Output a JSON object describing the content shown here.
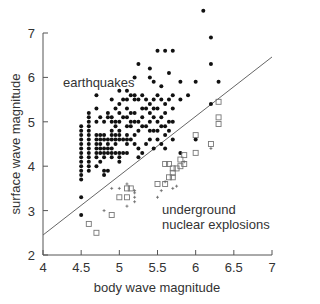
{
  "chart_data": {
    "type": "scatter",
    "title": "",
    "xlabel": "body wave magnitude",
    "ylabel": "surface wave magnitude",
    "xlim": [
      4,
      7
    ],
    "ylim": [
      2,
      7
    ],
    "xticks": [
      "4",
      "4.5",
      "5",
      "5.5",
      "6",
      "6.5",
      "7"
    ],
    "yticks": [
      "2",
      "3",
      "4",
      "5",
      "6",
      "7"
    ],
    "grid": false,
    "annotations": [
      {
        "text": "earthquakes",
        "x": 4.62,
        "y": 6.3
      },
      {
        "text": "underground",
        "x": 5.5,
        "y": 3.15
      },
      {
        "text": "nuclear explosions",
        "x": 5.5,
        "y": 2.85
      }
    ],
    "discriminant_line": {
      "x": [
        4,
        7
      ],
      "y": [
        2.45,
        6.46
      ]
    },
    "series": [
      {
        "name": "earthquakes",
        "marker": "filled-circle",
        "points": [
          [
            4.5,
            2.9
          ],
          [
            4.5,
            3.3
          ],
          [
            4.5,
            3.7
          ],
          [
            4.5,
            3.8
          ],
          [
            4.5,
            3.9
          ],
          [
            4.5,
            4.0
          ],
          [
            4.5,
            4.1
          ],
          [
            4.5,
            4.2
          ],
          [
            4.5,
            4.3
          ],
          [
            4.5,
            4.4
          ],
          [
            4.5,
            4.5
          ],
          [
            4.5,
            4.6
          ],
          [
            4.5,
            4.7
          ],
          [
            4.5,
            4.8
          ],
          [
            4.5,
            4.9
          ],
          [
            4.6,
            3.9
          ],
          [
            4.6,
            4.0
          ],
          [
            4.6,
            4.1
          ],
          [
            4.6,
            4.2
          ],
          [
            4.6,
            4.3
          ],
          [
            4.6,
            4.4
          ],
          [
            4.6,
            4.5
          ],
          [
            4.6,
            4.6
          ],
          [
            4.6,
            4.7
          ],
          [
            4.6,
            4.8
          ],
          [
            4.6,
            4.9
          ],
          [
            4.6,
            5.0
          ],
          [
            4.6,
            5.1
          ],
          [
            4.6,
            5.2
          ],
          [
            4.7,
            4.0
          ],
          [
            4.7,
            4.2
          ],
          [
            4.7,
            4.3
          ],
          [
            4.7,
            4.4
          ],
          [
            4.7,
            4.5
          ],
          [
            4.7,
            4.6
          ],
          [
            4.7,
            4.7
          ],
          [
            4.7,
            5.0
          ],
          [
            4.7,
            5.3
          ],
          [
            4.7,
            5.6
          ],
          [
            4.75,
            4.1
          ],
          [
            4.75,
            4.3
          ],
          [
            4.75,
            4.4
          ],
          [
            4.75,
            4.5
          ],
          [
            4.75,
            4.6
          ],
          [
            4.75,
            4.7
          ],
          [
            4.75,
            5.1
          ],
          [
            4.8,
            3.8
          ],
          [
            4.8,
            3.9
          ],
          [
            4.8,
            4.2
          ],
          [
            4.8,
            4.3
          ],
          [
            4.8,
            4.4
          ],
          [
            4.8,
            4.6
          ],
          [
            4.8,
            4.7
          ],
          [
            4.8,
            5.0
          ],
          [
            4.85,
            3.9
          ],
          [
            4.85,
            4.3
          ],
          [
            4.85,
            4.4
          ],
          [
            4.85,
            4.5
          ],
          [
            4.85,
            4.6
          ],
          [
            4.85,
            5.1
          ],
          [
            4.85,
            5.2
          ],
          [
            4.9,
            4.2
          ],
          [
            4.9,
            4.3
          ],
          [
            4.9,
            4.4
          ],
          [
            4.9,
            4.6
          ],
          [
            4.9,
            4.7
          ],
          [
            4.9,
            4.8
          ],
          [
            4.9,
            5.0
          ],
          [
            4.9,
            5.1
          ],
          [
            4.9,
            5.5
          ],
          [
            4.95,
            4.3
          ],
          [
            4.95,
            4.5
          ],
          [
            4.95,
            4.6
          ],
          [
            4.95,
            4.7
          ],
          [
            4.95,
            4.9
          ],
          [
            4.95,
            5.0
          ],
          [
            4.95,
            5.3
          ],
          [
            5.0,
            4.1
          ],
          [
            5.0,
            4.2
          ],
          [
            5.0,
            4.3
          ],
          [
            5.0,
            4.6
          ],
          [
            5.0,
            4.7
          ],
          [
            5.0,
            4.8
          ],
          [
            5.0,
            5.0
          ],
          [
            5.0,
            5.2
          ],
          [
            5.0,
            5.4
          ],
          [
            5.0,
            5.7
          ],
          [
            5.05,
            4.3
          ],
          [
            5.05,
            4.6
          ],
          [
            5.05,
            5.1
          ],
          [
            5.05,
            5.5
          ],
          [
            5.1,
            4.3
          ],
          [
            5.1,
            4.5
          ],
          [
            5.1,
            4.6
          ],
          [
            5.1,
            4.7
          ],
          [
            5.1,
            4.9
          ],
          [
            5.1,
            5.1
          ],
          [
            5.1,
            5.3
          ],
          [
            5.1,
            5.5
          ],
          [
            5.1,
            5.7
          ],
          [
            5.15,
            4.6
          ],
          [
            5.15,
            4.9
          ],
          [
            5.15,
            5.0
          ],
          [
            5.15,
            5.2
          ],
          [
            5.15,
            5.6
          ],
          [
            5.2,
            4.5
          ],
          [
            5.2,
            4.7
          ],
          [
            5.2,
            5.0
          ],
          [
            5.2,
            5.2
          ],
          [
            5.2,
            5.5
          ],
          [
            5.2,
            5.6
          ],
          [
            5.2,
            6.0
          ],
          [
            5.25,
            4.2
          ],
          [
            5.25,
            4.4
          ],
          [
            5.25,
            4.8
          ],
          [
            5.25,
            5.0
          ],
          [
            5.25,
            5.5
          ],
          [
            5.25,
            6.3
          ],
          [
            5.3,
            4.3
          ],
          [
            5.3,
            4.9
          ],
          [
            5.3,
            5.1
          ],
          [
            5.3,
            5.3
          ],
          [
            5.3,
            5.6
          ],
          [
            5.35,
            4.5
          ],
          [
            5.35,
            4.9
          ],
          [
            5.35,
            5.3
          ],
          [
            5.35,
            5.5
          ],
          [
            5.4,
            4.6
          ],
          [
            5.4,
            4.8
          ],
          [
            5.4,
            5.0
          ],
          [
            5.4,
            5.2
          ],
          [
            5.4,
            5.4
          ],
          [
            5.4,
            6.0
          ],
          [
            5.4,
            6.2
          ],
          [
            5.45,
            4.4
          ],
          [
            5.45,
            4.8
          ],
          [
            5.45,
            5.1
          ],
          [
            5.45,
            5.3
          ],
          [
            5.45,
            5.5
          ],
          [
            5.45,
            5.9
          ],
          [
            5.5,
            4.6
          ],
          [
            5.5,
            4.8
          ],
          [
            5.5,
            5.0
          ],
          [
            5.5,
            5.3
          ],
          [
            5.5,
            5.6
          ],
          [
            5.5,
            6.6
          ],
          [
            5.55,
            4.5
          ],
          [
            5.55,
            4.9
          ],
          [
            5.55,
            5.1
          ],
          [
            5.55,
            5.5
          ],
          [
            5.55,
            5.8
          ],
          [
            5.6,
            4.4
          ],
          [
            5.6,
            4.7
          ],
          [
            5.6,
            4.9
          ],
          [
            5.6,
            5.2
          ],
          [
            5.6,
            5.4
          ],
          [
            5.6,
            6.6
          ],
          [
            5.65,
            4.8
          ],
          [
            5.65,
            5.0
          ],
          [
            5.65,
            5.5
          ],
          [
            5.65,
            6.1
          ],
          [
            5.7,
            4.6
          ],
          [
            5.7,
            5.0
          ],
          [
            5.7,
            5.3
          ],
          [
            5.7,
            5.6
          ],
          [
            5.7,
            6.6
          ],
          [
            5.8,
            4.3
          ],
          [
            5.8,
            5.5
          ],
          [
            5.8,
            5.9
          ],
          [
            5.9,
            5.6
          ],
          [
            6.0,
            4.6
          ],
          [
            6.0,
            5.9
          ],
          [
            6.2,
            5.4
          ],
          [
            6.2,
            6.3
          ],
          [
            6.2,
            6.9
          ],
          [
            6.1,
            7.5
          ],
          [
            6.3,
            5.9
          ]
        ]
      },
      {
        "name": "underground nuclear explosions (squares)",
        "marker": "open-square",
        "points": [
          [
            4.6,
            2.7
          ],
          [
            4.7,
            2.5
          ],
          [
            4.9,
            2.9
          ],
          [
            5.0,
            3.3
          ],
          [
            5.1,
            3.3
          ],
          [
            5.1,
            3.5
          ],
          [
            5.15,
            3.5
          ],
          [
            5.5,
            3.6
          ],
          [
            5.6,
            3.6
          ],
          [
            5.65,
            3.75
          ],
          [
            5.7,
            3.75
          ],
          [
            5.7,
            3.85
          ],
          [
            5.7,
            3.95
          ],
          [
            5.6,
            4.05
          ],
          [
            5.65,
            4.05
          ],
          [
            5.75,
            3.95
          ],
          [
            5.8,
            4.0
          ],
          [
            5.85,
            4.05
          ],
          [
            5.8,
            4.15
          ],
          [
            5.85,
            4.25
          ],
          [
            6.0,
            4.3
          ],
          [
            6.0,
            4.7
          ],
          [
            6.2,
            4.5
          ],
          [
            6.3,
            4.95
          ],
          [
            6.3,
            5.1
          ],
          [
            6.3,
            5.45
          ]
        ]
      },
      {
        "name": "underground nuclear explosions (crosses)",
        "marker": "small-cross",
        "points": [
          [
            4.8,
            3.0
          ],
          [
            4.9,
            3.5
          ],
          [
            5.0,
            3.5
          ],
          [
            5.1,
            3.6
          ],
          [
            5.1,
            3.1
          ],
          [
            5.2,
            3.2
          ],
          [
            5.2,
            3.3
          ],
          [
            5.2,
            3.4
          ],
          [
            5.5,
            3.3
          ],
          [
            5.6,
            3.65
          ],
          [
            5.7,
            3.5
          ],
          [
            5.85,
            4.1
          ],
          [
            5.75,
            3.55
          ],
          [
            5.55,
            3.45
          ],
          [
            5.2,
            3.45
          ],
          [
            6.2,
            4.4
          ]
        ]
      }
    ]
  }
}
